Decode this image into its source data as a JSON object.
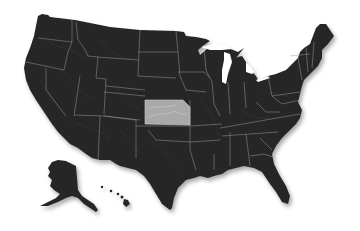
{
  "map": {
    "title": "United States",
    "type": "state-outline map",
    "style": "dark shaded relief",
    "highlighted_state": "Kansas",
    "colors": {
      "background": "#ffffff",
      "land": "#262626",
      "borders": "#9a9a9a",
      "highlight": "#a9a9a9"
    },
    "insets": [
      "Alaska",
      "Hawaii"
    ]
  }
}
